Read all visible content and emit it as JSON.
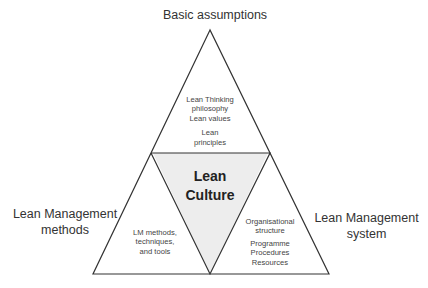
{
  "diagram": {
    "top_label": "Basic assumptions",
    "left_label_line1": "Lean Management",
    "left_label_line2": "methods",
    "right_label_line1": "Lean Management",
    "right_label_line2": "system",
    "center": {
      "line1": "Lean",
      "line2": "Culture",
      "fill": "#ededed"
    },
    "top_triangle": {
      "lines": [
        "Lean Thinking",
        "philosophy",
        "Lean values"
      ],
      "lines2": [
        "Lean",
        "principles"
      ]
    },
    "left_triangle": {
      "lines": [
        "LM methods,",
        "techniques,",
        "and tools"
      ]
    },
    "right_triangle": {
      "lines": [
        "Organisational",
        "structure"
      ],
      "lines2": [
        "Programme",
        "Procedures",
        "Resources"
      ]
    },
    "stroke_color": "#333333"
  }
}
